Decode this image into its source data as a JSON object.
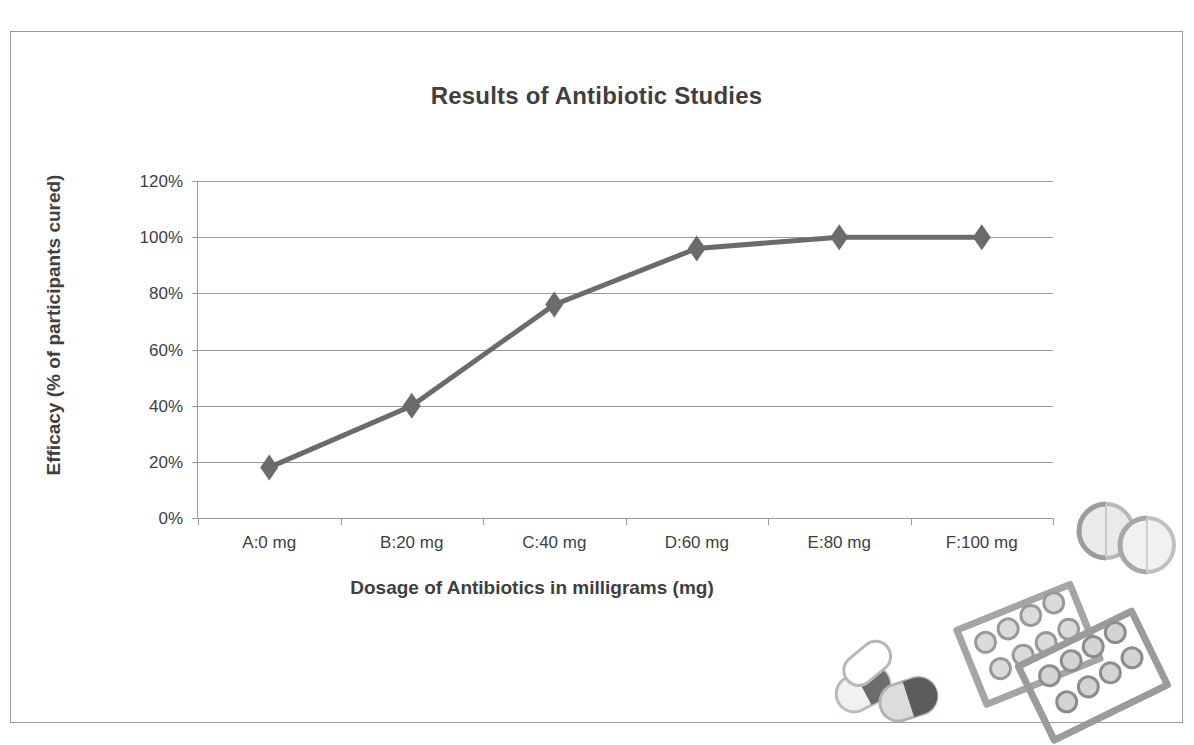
{
  "figure": {
    "border_color": "#9b9b9b",
    "background": "#ffffff"
  },
  "chart_data": {
    "type": "line",
    "title": "Results of Antibiotic Studies",
    "xlabel": "Dosage of Antibiotics in milligrams (mg)",
    "ylabel": "Efficacy (% of participants cured)",
    "categories": [
      "A:0 mg",
      "B:20 mg",
      "C:40 mg",
      "D:60 mg",
      "E:80 mg",
      "F:100 mg"
    ],
    "values": [
      18,
      40,
      76,
      96,
      100,
      100
    ],
    "y_tick_labels": [
      "0%",
      "20%",
      "40%",
      "60%",
      "80%",
      "100%",
      "120%"
    ],
    "y_ticks": [
      0,
      20,
      40,
      60,
      80,
      100,
      120
    ],
    "ylim": [
      0,
      120
    ],
    "grid": "horizontal",
    "legend": "none",
    "marker": "diamond",
    "series_color": "#6b6b6b",
    "grid_color": "#9a9a9a",
    "text_color": "#3f3f3f",
    "series": [
      {
        "name": "Efficacy",
        "points": [
          {
            "category": "A:0 mg",
            "dose_mg": 0,
            "value": 18
          },
          {
            "category": "B:20 mg",
            "dose_mg": 20,
            "value": 40
          },
          {
            "category": "C:40 mg",
            "dose_mg": 40,
            "value": 76
          },
          {
            "category": "D:60 mg",
            "dose_mg": 60,
            "value": 96
          },
          {
            "category": "E:80 mg",
            "dose_mg": 80,
            "value": 100
          },
          {
            "category": "F:100 mg",
            "dose_mg": 100,
            "value": 100
          }
        ]
      }
    ]
  },
  "decoration": {
    "artwork_name": "pills-and-blister-packs-clipart",
    "elements": [
      "round-tablet",
      "round-tablet",
      "capsule",
      "capsule",
      "blister-pack",
      "blister-pack"
    ]
  }
}
